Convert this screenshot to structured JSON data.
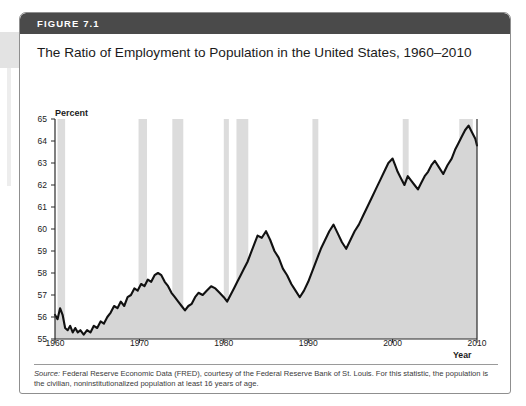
{
  "figure": {
    "number_label": "FIGURE 7.1",
    "title": "The Ratio of Employment to Population in the United States, 1960–2010",
    "source_prefix": "Source:",
    "source_text": " Federal Reserve Economic Data (FRED), courtesy of the Federal Reserve Bank of St. Louis. For this statistic, the population is the civilian, noninstitutionalized population at least 16 years of age."
  },
  "colors": {
    "header_bar": "#4a4a4a",
    "figure_border": "#8f8f8f",
    "line": "#111111",
    "area_fill": "#d6d6d6",
    "recession_band": "#dcdcdc",
    "axis": "#2b2b2b",
    "text": "#1b1b1b"
  },
  "chart_data": {
    "type": "area",
    "title": "The Ratio of Employment to Population in the United States, 1960–2010",
    "xlabel": "Year",
    "ylabel": "Percent",
    "ylabel_position": "top-left",
    "xlim": [
      1960,
      2010
    ],
    "ylim": [
      55,
      65
    ],
    "grid": false,
    "legend": null,
    "y_ticks": [
      55,
      56,
      57,
      58,
      59,
      60,
      61,
      62,
      63,
      64,
      65
    ],
    "x_ticks": [
      1960,
      1970,
      1980,
      1990,
      2000,
      2010
    ],
    "x_tick_labels": [
      "1960",
      "1970",
      "1980",
      "1990",
      "2000",
      "2010"
    ],
    "y_tick_labels": [
      "55",
      "56",
      "57",
      "58",
      "59",
      "60",
      "61",
      "62",
      "63",
      "64",
      "65"
    ],
    "series_name": "Employment-to-population ratio",
    "annotations": [],
    "shaded_bands": {
      "name": "recessions",
      "ranges": [
        [
          1960.3,
          1961.2
        ],
        [
          1969.9,
          1970.9
        ],
        [
          1973.9,
          1975.2
        ],
        [
          1980.0,
          1980.6
        ],
        [
          1981.5,
          1982.9
        ],
        [
          1990.5,
          1991.2
        ],
        [
          2001.2,
          2001.9
        ],
        [
          2007.9,
          2009.5
        ]
      ]
    },
    "x": [
      1960.0,
      1960.3,
      1960.6,
      1960.9,
      1961.2,
      1961.5,
      1961.8,
      1962.1,
      1962.4,
      1962.7,
      1963.0,
      1963.4,
      1963.8,
      1964.2,
      1964.6,
      1965.0,
      1965.4,
      1965.8,
      1966.2,
      1966.6,
      1967.0,
      1967.4,
      1967.8,
      1968.2,
      1968.6,
      1969.0,
      1969.4,
      1969.8,
      1970.2,
      1970.6,
      1971.0,
      1971.4,
      1971.8,
      1972.2,
      1972.6,
      1973.0,
      1973.4,
      1973.8,
      1974.2,
      1974.6,
      1975.0,
      1975.4,
      1975.8,
      1976.2,
      1976.6,
      1977.0,
      1977.5,
      1978.0,
      1978.5,
      1979.0,
      1979.5,
      1980.0,
      1980.4,
      1980.8,
      1981.2,
      1981.6,
      1982.0,
      1982.4,
      1982.8,
      1983.2,
      1983.6,
      1984.0,
      1984.5,
      1985.0,
      1985.5,
      1986.0,
      1986.5,
      1987.0,
      1987.5,
      1988.0,
      1988.5,
      1989.0,
      1989.5,
      1990.0,
      1990.5,
      1991.0,
      1991.5,
      1992.0,
      1992.5,
      1993.0,
      1993.5,
      1994.0,
      1994.5,
      1995.0,
      1995.5,
      1996.0,
      1996.5,
      1997.0,
      1997.5,
      1998.0,
      1998.5,
      1999.0,
      1999.5,
      2000.0,
      2000.3,
      2000.6,
      2001.0,
      2001.4,
      2001.8,
      2002.2,
      2002.6,
      2003.0,
      2003.4,
      2003.8,
      2004.2,
      2004.6,
      2005.0,
      2005.5,
      2006.0,
      2006.5,
      2007.0,
      2007.4,
      2007.8,
      2008.2,
      2008.6,
      2009.0,
      2009.4,
      2009.8,
      2010.0
    ],
    "y": [
      56.1,
      55.9,
      56.4,
      56.1,
      55.5,
      55.4,
      55.6,
      55.3,
      55.5,
      55.3,
      55.4,
      55.2,
      55.4,
      55.3,
      55.6,
      55.5,
      55.8,
      55.7,
      56.0,
      56.2,
      56.5,
      56.4,
      56.7,
      56.5,
      56.9,
      57.0,
      57.3,
      57.2,
      57.5,
      57.4,
      57.7,
      57.6,
      57.9,
      58.0,
      57.9,
      57.6,
      57.4,
      57.1,
      56.9,
      56.7,
      56.5,
      56.3,
      56.5,
      56.6,
      56.9,
      57.1,
      57.0,
      57.2,
      57.4,
      57.3,
      57.1,
      56.9,
      56.7,
      57.0,
      57.3,
      57.6,
      57.9,
      58.2,
      58.5,
      58.9,
      59.3,
      59.7,
      59.6,
      59.9,
      59.5,
      59.0,
      58.7,
      58.2,
      57.9,
      57.5,
      57.2,
      56.9,
      57.2,
      57.6,
      58.1,
      58.6,
      59.1,
      59.5,
      59.9,
      60.2,
      59.8,
      59.4,
      59.1,
      59.5,
      59.9,
      60.2,
      60.6,
      61.0,
      61.4,
      61.8,
      62.2,
      62.6,
      63.0,
      63.2,
      62.9,
      62.6,
      62.3,
      62.0,
      62.4,
      62.2,
      62.0,
      61.8,
      62.1,
      62.4,
      62.6,
      62.9,
      63.1,
      62.8,
      62.5,
      62.9,
      63.2,
      63.6,
      63.9,
      64.2,
      64.5,
      64.7,
      64.4,
      64.1,
      63.8,
      63.4,
      63.0,
      62.7,
      62.4,
      62.2,
      62.4,
      62.6,
      62.3,
      62.0,
      61.8,
      62.0,
      62.3,
      62.6,
      62.9,
      63.1,
      63.3,
      63.4,
      63.2,
      63.1,
      63.3,
      63.0,
      62.6,
      62.0,
      61.3,
      60.5,
      59.6,
      58.9,
      58.4,
      58.2,
      58.3
    ]
  }
}
